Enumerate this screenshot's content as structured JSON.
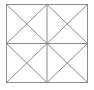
{
  "page": {
    "background_color": "#ffffff",
    "width": 94,
    "height": 90
  },
  "figure": {
    "name": "square-subdivided-into-triangles",
    "shape_type": "line-drawing",
    "stroke_color": "#8c8c8c",
    "fill_color": "#ffffff",
    "stroke_width": 1,
    "bounds": {
      "x": 6.5,
      "y": 4.5,
      "width": 81,
      "height": 78
    },
    "counts": {
      "quadrants": 4,
      "small_triangles": 16,
      "line_segments": 14,
      "vertices": 9
    },
    "vertices": [
      {
        "name": "top-left-corner",
        "x": 6.5,
        "y": 4.5
      },
      {
        "name": "top-mid",
        "x": 47.0,
        "y": 4.5
      },
      {
        "name": "top-right-corner",
        "x": 87.5,
        "y": 4.5
      },
      {
        "name": "left-mid",
        "x": 6.5,
        "y": 43.5
      },
      {
        "name": "center",
        "x": 47.0,
        "y": 43.5
      },
      {
        "name": "right-mid",
        "x": 87.5,
        "y": 43.5
      },
      {
        "name": "bottom-left-corner",
        "x": 6.5,
        "y": 82.5
      },
      {
        "name": "bottom-mid",
        "x": 47.0,
        "y": 82.5
      },
      {
        "name": "bottom-right-corner",
        "x": 87.5,
        "y": 82.5
      }
    ],
    "segments": [
      {
        "name": "outer-top-edge",
        "x1": 6.5,
        "y1": 4.5,
        "x2": 87.5,
        "y2": 4.5
      },
      {
        "name": "outer-right-edge",
        "x1": 87.5,
        "y1": 4.5,
        "x2": 87.5,
        "y2": 82.5
      },
      {
        "name": "outer-bottom-edge",
        "x1": 87.5,
        "y1": 82.5,
        "x2": 6.5,
        "y2": 82.5
      },
      {
        "name": "outer-left-edge",
        "x1": 6.5,
        "y1": 82.5,
        "x2": 6.5,
        "y2": 4.5
      },
      {
        "name": "vertical-median",
        "x1": 47.0,
        "y1": 4.5,
        "x2": 47.0,
        "y2": 82.5
      },
      {
        "name": "horizontal-median",
        "x1": 6.5,
        "y1": 43.5,
        "x2": 87.5,
        "y2": 43.5
      },
      {
        "name": "q-tl-diagonal-main",
        "x1": 6.5,
        "y1": 4.5,
        "x2": 47.0,
        "y2": 43.5
      },
      {
        "name": "q-tl-diagonal-anti",
        "x1": 47.0,
        "y1": 4.5,
        "x2": 6.5,
        "y2": 43.5
      },
      {
        "name": "q-tr-diagonal-main",
        "x1": 47.0,
        "y1": 4.5,
        "x2": 87.5,
        "y2": 43.5
      },
      {
        "name": "q-tr-diagonal-anti",
        "x1": 87.5,
        "y1": 4.5,
        "x2": 47.0,
        "y2": 43.5
      },
      {
        "name": "q-bl-diagonal-main",
        "x1": 6.5,
        "y1": 43.5,
        "x2": 47.0,
        "y2": 82.5
      },
      {
        "name": "q-bl-diagonal-anti",
        "x1": 47.0,
        "y1": 43.5,
        "x2": 6.5,
        "y2": 82.5
      },
      {
        "name": "q-br-diagonal-main",
        "x1": 47.0,
        "y1": 43.5,
        "x2": 87.5,
        "y2": 82.5
      },
      {
        "name": "q-br-diagonal-anti",
        "x1": 87.5,
        "y1": 43.5,
        "x2": 47.0,
        "y2": 82.5
      }
    ]
  }
}
